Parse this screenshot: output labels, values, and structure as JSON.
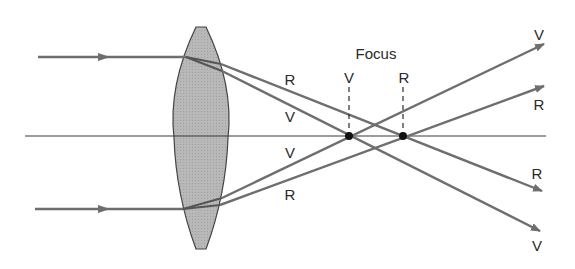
{
  "diagram": {
    "colors": {
      "ray": "#6e6e6e",
      "axis": "#3a3a3a",
      "lens_fill": "#b4b4b4",
      "lens_stroke": "#444444",
      "focus_dot": "#111111",
      "text": "#2a2a2a"
    },
    "labels": {
      "focus": "Focus",
      "focus_v": "V",
      "focus_r": "R",
      "top_r_mid": "R",
      "top_v_mid": "V",
      "bottom_v_mid": "V",
      "bottom_r_mid": "R",
      "out_top_v": "V",
      "out_top_r": "R",
      "out_bottom_r": "R",
      "out_bottom_v": "V"
    },
    "legend": {
      "V": "violet light",
      "R": "red light"
    },
    "geometry": {
      "axis": {
        "x1": 25,
        "x2": 546,
        "y": 136
      },
      "lens": {
        "cx": 201,
        "top": 27,
        "bottom": 249,
        "half_width": 27
      },
      "focus_v": {
        "x": 349,
        "y": 136
      },
      "focus_r": {
        "x": 403,
        "y": 136
      },
      "incoming_top": {
        "x1": 38,
        "x2": 186,
        "y": 57
      },
      "incoming_bottom": {
        "x1": 35,
        "x2": 183,
        "y": 209
      }
    }
  }
}
